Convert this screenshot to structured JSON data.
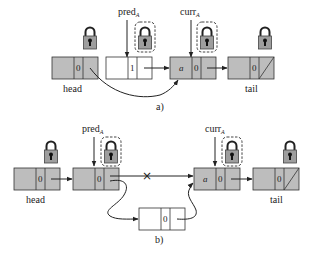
{
  "diagram": {
    "colors": {
      "locked_node_fill": "#bdbdbd",
      "unlocked_node_fill": "#ffffff",
      "stroke": "#333333",
      "lock_body": "#9e9e9e",
      "lock_keyhole": "#111111",
      "lock_frame_dashed": "#444444"
    },
    "panels": [
      {
        "caption": "a)",
        "pointers": [
          {
            "name": "pred",
            "subscript": "A"
          },
          {
            "name": "curr",
            "subscript": "A"
          }
        ],
        "nodes": [
          {
            "id": "head",
            "label": "head",
            "key": "",
            "mark": "0",
            "locked": true,
            "shaded": true
          },
          {
            "id": "pred",
            "label": "",
            "key": "",
            "mark": "1",
            "locked": true,
            "lock_highlighted": true,
            "shaded": false
          },
          {
            "id": "curr",
            "label": "",
            "key": "a",
            "mark": "0",
            "locked": true,
            "lock_highlighted": true,
            "shaded": true
          },
          {
            "id": "tail",
            "label": "tail",
            "key": "",
            "mark": "0",
            "locked": true,
            "shaded": true,
            "null_next": true
          }
        ],
        "edges": [
          {
            "from": "head",
            "to": "curr",
            "style": "curved"
          },
          {
            "from": "pred",
            "to": "curr",
            "style": "straight"
          },
          {
            "from": "curr",
            "to": "tail",
            "style": "straight"
          }
        ]
      },
      {
        "caption": "b)",
        "pointers": [
          {
            "name": "pred",
            "subscript": "A"
          },
          {
            "name": "curr",
            "subscript": "A"
          }
        ],
        "nodes": [
          {
            "id": "head",
            "label": "head",
            "key": "",
            "mark": "0",
            "locked": true,
            "shaded": true
          },
          {
            "id": "pred",
            "label": "",
            "key": "",
            "mark": "0",
            "locked": true,
            "lock_highlighted": true,
            "shaded": true
          },
          {
            "id": "curr",
            "label": "",
            "key": "a",
            "mark": "0",
            "locked": true,
            "lock_highlighted": true,
            "shaded": true
          },
          {
            "id": "tail",
            "label": "tail",
            "key": "",
            "mark": "0",
            "locked": true,
            "shaded": true,
            "null_next": true
          },
          {
            "id": "new",
            "label": "",
            "key": "",
            "mark": "0",
            "locked": false,
            "shaded": false
          }
        ],
        "edges": [
          {
            "from": "head",
            "to": "pred",
            "style": "straight"
          },
          {
            "from": "pred",
            "to": "curr",
            "style": "straight",
            "crossed": true,
            "cross_symbol": "×"
          },
          {
            "from": "pred",
            "to": "new",
            "style": "curved"
          },
          {
            "from": "new",
            "to": "curr",
            "style": "curved"
          },
          {
            "from": "curr",
            "to": "tail",
            "style": "straight"
          }
        ]
      }
    ]
  }
}
